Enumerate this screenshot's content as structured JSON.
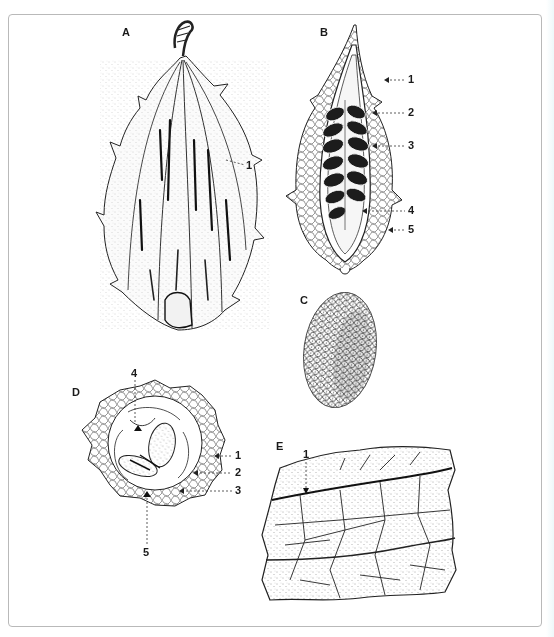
{
  "figure": {
    "panels": [
      {
        "id": "A",
        "label": "A",
        "subject": "whole fruit, exterior",
        "callouts": [
          "1"
        ]
      },
      {
        "id": "B",
        "label": "B",
        "subject": "fruit, longitudinal section",
        "callouts": [
          "1",
          "2",
          "3",
          "4",
          "5"
        ]
      },
      {
        "id": "C",
        "label": "C",
        "subject": "seed"
      },
      {
        "id": "D",
        "label": "D",
        "subject": "fruit, transverse section",
        "callouts": [
          "1",
          "2",
          "3",
          "4",
          "5"
        ]
      },
      {
        "id": "E",
        "label": "E",
        "subject": "leaf surface detail",
        "callouts": [
          "1"
        ]
      }
    ],
    "colors": {
      "frame": "#b9b9b9",
      "ink": "#1a1a1a",
      "background": "#ffffff"
    }
  }
}
